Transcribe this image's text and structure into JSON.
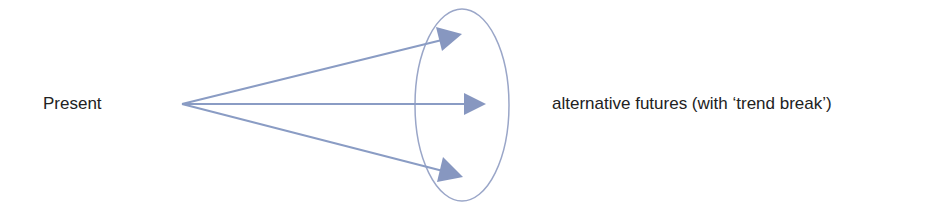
{
  "diagram": {
    "source_label": "Present",
    "target_label": "alternative futures (with ‘trend break’)",
    "arrow_count": 3,
    "colors": {
      "line": "#8a9cc4",
      "arrowhead": "#8797c0",
      "ellipse": "#9aa6c8",
      "text": "#222222",
      "background": "#ffffff"
    }
  }
}
